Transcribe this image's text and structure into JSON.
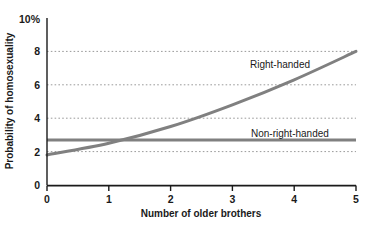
{
  "chart_data": {
    "type": "line",
    "title": "",
    "xlabel": "Number of older brothers",
    "ylabel": "Probability of homosexuality",
    "xlim": [
      0,
      5
    ],
    "ylim": [
      0,
      10
    ],
    "x_ticks": [
      "0",
      "1",
      "2",
      "3",
      "4",
      "5"
    ],
    "y_ticks": [
      "0",
      "2",
      "4",
      "6",
      "8",
      "10%"
    ],
    "y_tick_values": [
      0,
      2,
      4,
      6,
      8,
      10
    ],
    "x_tick_values": [
      0,
      1,
      2,
      3,
      4,
      5
    ],
    "grid": "horizontal-dotted",
    "gridlines_at": [
      2,
      4,
      6,
      8
    ],
    "legend_position": "inline-annotation",
    "x": [
      0,
      1,
      2,
      3,
      4,
      5
    ],
    "series": [
      {
        "name": "Right-handed",
        "values": [
          1.8,
          2.5,
          3.5,
          4.8,
          6.3,
          8.0
        ],
        "label": "Right-handed",
        "color": "#808080"
      },
      {
        "name": "Non-right-handed",
        "values": [
          2.7,
          2.7,
          2.7,
          2.7,
          2.7,
          2.7
        ],
        "label": "Non-right-handed",
        "color": "#808080"
      }
    ],
    "colors": {
      "line": "#808080",
      "grid": "#9a9a9a",
      "axis": "#1a1a1a",
      "text": "#1a1a1a",
      "background": "#ffffff"
    }
  },
  "labels": {
    "y_axis_title": "Probability of homosexuality",
    "x_axis_title": "Number of older brothers",
    "series_right_handed": "Right-handed",
    "series_non_right_handed": "Non-right-handed",
    "ytick_0": "0",
    "ytick_2": "2",
    "ytick_4": "4",
    "ytick_6": "6",
    "ytick_8": "8",
    "ytick_10": "10%",
    "xtick_0": "0",
    "xtick_1": "1",
    "xtick_2": "2",
    "xtick_3": "3",
    "xtick_4": "4",
    "xtick_5": "5"
  }
}
